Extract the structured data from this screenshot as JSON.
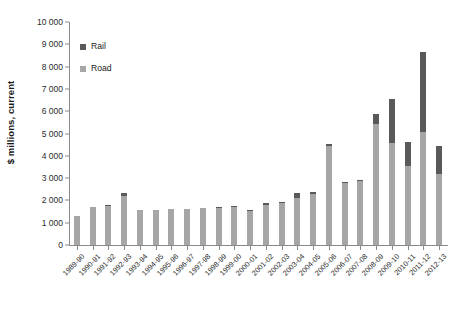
{
  "chart_data": {
    "type": "bar",
    "stacked": true,
    "title": "",
    "subtitle": "",
    "xlabel": "",
    "ylabel": "$ millions, current",
    "ylim": [
      0,
      10000
    ],
    "ytick_step": 1000,
    "grid": false,
    "legend_position": "top-left-inside",
    "categories": [
      "1989-90",
      "1990-91",
      "1991-92",
      "1992-93",
      "1993-94",
      "1994-95",
      "1995-96",
      "1996-97",
      "1997-98",
      "1998-99",
      "1999-00",
      "2000-01",
      "2001-02",
      "2002-03",
      "2003-04",
      "2004-05",
      "2005-06",
      "2006-07",
      "2007-08",
      "2008-09",
      "2009-10",
      "2010-11",
      "2011-12",
      "2012-13"
    ],
    "ytick_labels": [
      "0",
      "1 000",
      "2 000",
      "3 000",
      "4 000",
      "5 000",
      "6 000",
      "7 000",
      "8 000",
      "9 000",
      "10 000"
    ],
    "ytick_values": [
      0,
      1000,
      2000,
      3000,
      4000,
      5000,
      6000,
      7000,
      8000,
      9000,
      10000
    ],
    "series": [
      {
        "name": "Road",
        "color": "#a6a6a6",
        "values": [
          1300,
          1690,
          1740,
          2220,
          1570,
          1560,
          1600,
          1610,
          1650,
          1680,
          1700,
          1560,
          1800,
          1890,
          2120,
          2270,
          4440,
          2800,
          2860,
          5440,
          4580,
          3540,
          5080,
          3200
        ]
      },
      {
        "name": "Rail",
        "color": "#595959",
        "values": [
          0,
          0,
          40,
          110,
          0,
          0,
          0,
          0,
          0,
          30,
          30,
          20,
          80,
          30,
          200,
          130,
          110,
          40,
          70,
          450,
          1960,
          1080,
          3580,
          1250
        ]
      }
    ],
    "totals": [
      1300,
      1690,
      1780,
      2330,
      1570,
      1560,
      1600,
      1610,
      1650,
      1710,
      1730,
      1580,
      1880,
      1920,
      2320,
      2400,
      4550,
      2840,
      2930,
      5890,
      6540,
      4620,
      8660,
      4450
    ]
  },
  "legend": {
    "items": [
      {
        "label": "Rail",
        "color": "#595959"
      },
      {
        "label": "Road",
        "color": "#a6a6a6"
      }
    ]
  },
  "axes": {
    "y_title": "$ millions, current"
  }
}
